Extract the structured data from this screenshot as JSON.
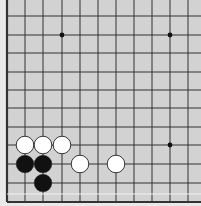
{
  "board": {
    "description": "Go board lower-left corner (partial view)",
    "background": "#d2d2d2",
    "line_color": "#333333",
    "edges": [
      "left",
      "bottom"
    ],
    "columns_x": [
      7,
      25,
      43,
      62,
      80,
      98,
      116,
      134,
      152,
      170,
      188
    ],
    "rows_y": [
      16,
      35,
      53,
      72,
      90,
      108,
      127,
      145,
      164,
      183,
      202
    ],
    "star_points": [
      {
        "col": 3,
        "row": 1
      },
      {
        "col": 9,
        "row": 1
      },
      {
        "col": 9,
        "row": 7
      }
    ],
    "stones": [
      {
        "color": "white",
        "col": 1,
        "row": 7
      },
      {
        "color": "white",
        "col": 2,
        "row": 7
      },
      {
        "color": "white",
        "col": 3,
        "row": 7
      },
      {
        "color": "black",
        "col": 1,
        "row": 8
      },
      {
        "color": "black",
        "col": 2,
        "row": 8
      },
      {
        "color": "white",
        "col": 4,
        "row": 8
      },
      {
        "color": "white",
        "col": 6,
        "row": 8
      },
      {
        "color": "black",
        "col": 2,
        "row": 9
      }
    ]
  }
}
